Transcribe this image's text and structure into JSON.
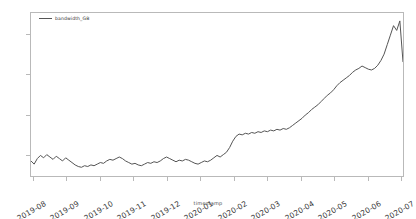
{
  "figure": {
    "background": "#ffffff",
    "frame_color": "#b9b9b9"
  },
  "legend": {
    "label": "bandwidth_GB",
    "position": "upper-left-inside"
  },
  "axes": {
    "xlabel": "timestamp",
    "ylabel": "",
    "yticks": [
      "750",
      "800",
      "850",
      "900"
    ],
    "xticks": [
      "2019-08",
      "2019-09",
      "2019-10",
      "2019-11",
      "2019-12",
      "2020-01",
      "2020-02",
      "2020-03",
      "2020-04",
      "2020-05",
      "2020-06",
      "2020-07"
    ]
  },
  "chart_data": {
    "type": "line",
    "title": "",
    "xlabel": "timestamp",
    "ylabel": "",
    "grid": false,
    "legend_position": "upper left",
    "line_color": "#555555",
    "line_width": 1,
    "ylim": [
      722,
      928
    ],
    "xlim": [
      "2019-08-01",
      "2020-07-20"
    ],
    "categories": [
      "2019-08",
      "2019-09",
      "2019-10",
      "2019-11",
      "2019-12",
      "2020-01",
      "2020-02",
      "2020-03",
      "2020-04",
      "2020-05",
      "2020-06",
      "2020-07"
    ],
    "series": [
      {
        "name": "bandwidth_GB",
        "x": [
          "2019-08-01",
          "2019-08-04",
          "2019-08-07",
          "2019-08-10",
          "2019-08-13",
          "2019-08-16",
          "2019-08-19",
          "2019-08-22",
          "2019-08-25",
          "2019-08-28",
          "2019-08-31",
          "2019-09-03",
          "2019-09-06",
          "2019-09-09",
          "2019-09-12",
          "2019-09-15",
          "2019-09-18",
          "2019-09-21",
          "2019-09-24",
          "2019-09-27",
          "2019-09-30",
          "2019-10-03",
          "2019-10-06",
          "2019-10-09",
          "2019-10-12",
          "2019-10-15",
          "2019-10-18",
          "2019-10-21",
          "2019-10-24",
          "2019-10-27",
          "2019-10-30",
          "2019-11-02",
          "2019-11-05",
          "2019-11-08",
          "2019-11-11",
          "2019-11-14",
          "2019-11-17",
          "2019-11-20",
          "2019-11-23",
          "2019-11-26",
          "2019-11-29",
          "2019-12-02",
          "2019-12-05",
          "2019-12-08",
          "2019-12-11",
          "2019-12-14",
          "2019-12-17",
          "2019-12-20",
          "2019-12-23",
          "2019-12-26",
          "2019-12-29",
          "2020-01-01",
          "2020-01-04",
          "2020-01-07",
          "2020-01-10",
          "2020-01-13",
          "2020-01-16",
          "2020-01-19",
          "2020-01-22",
          "2020-01-25",
          "2020-01-28",
          "2020-01-31",
          "2020-02-03",
          "2020-02-06",
          "2020-02-09",
          "2020-02-12",
          "2020-02-15",
          "2020-02-18",
          "2020-02-21",
          "2020-02-24",
          "2020-02-27",
          "2020-03-01",
          "2020-03-04",
          "2020-03-07",
          "2020-03-10",
          "2020-03-13",
          "2020-03-16",
          "2020-03-19",
          "2020-03-22",
          "2020-03-25",
          "2020-03-28",
          "2020-03-31",
          "2020-04-03",
          "2020-04-06",
          "2020-04-09",
          "2020-04-12",
          "2020-04-15",
          "2020-04-18",
          "2020-04-21",
          "2020-04-24",
          "2020-04-27",
          "2020-04-30",
          "2020-05-03",
          "2020-05-06",
          "2020-05-09",
          "2020-05-12",
          "2020-05-15",
          "2020-05-18",
          "2020-05-21",
          "2020-05-24",
          "2020-05-27",
          "2020-05-30",
          "2020-06-02",
          "2020-06-05",
          "2020-06-08",
          "2020-06-11",
          "2020-06-14",
          "2020-06-17",
          "2020-06-20",
          "2020-06-23",
          "2020-06-26",
          "2020-06-29",
          "2020-07-02",
          "2020-07-05",
          "2020-07-08",
          "2020-07-11",
          "2020-07-14",
          "2020-07-17"
        ],
        "values": [
          741,
          737,
          744,
          748,
          745,
          749,
          746,
          743,
          747,
          744,
          741,
          745,
          742,
          739,
          736,
          734,
          733,
          735,
          734,
          736,
          735,
          737,
          739,
          738,
          741,
          743,
          742,
          744,
          746,
          744,
          741,
          739,
          737,
          738,
          736,
          735,
          737,
          739,
          738,
          740,
          739,
          741,
          744,
          746,
          744,
          742,
          740,
          742,
          741,
          743,
          742,
          740,
          738,
          737,
          739,
          741,
          740,
          742,
          745,
          748,
          746,
          749,
          752,
          758,
          766,
          772,
          775,
          774,
          776,
          775,
          777,
          776,
          778,
          777,
          779,
          778,
          780,
          779,
          781,
          780,
          782,
          781,
          783,
          786,
          789,
          792,
          795,
          799,
          802,
          806,
          809,
          812,
          816,
          820,
          824,
          827,
          831,
          836,
          840,
          843,
          846,
          849,
          853,
          856,
          858,
          861,
          859,
          857,
          856,
          858,
          862,
          868,
          876,
          888,
          900,
          912,
          906,
          918
        ],
        "end_value": 866
      }
    ],
    "annotations": {
      "baseline_mean": 741,
      "step_up_date": "2020-02",
      "plateau_mean": 779,
      "peak_value": 920,
      "final_value": 866
    }
  }
}
